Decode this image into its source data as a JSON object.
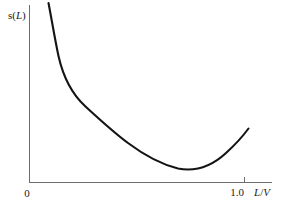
{
  "figure": {
    "background_color": "#ffffff",
    "curve_color": "#141414",
    "axis_color": "#6e6e6e",
    "text_color": "#1a1a1a"
  },
  "labels": {
    "ylabel_prefix": "s(",
    "ylabel_italic": "L",
    "ylabel_suffix": ")",
    "ylabel_full": "s(L)",
    "xlabel_numerator": "L",
    "xlabel_slash": "/",
    "xlabel_denominator": "V",
    "xlabel_full": "L/V",
    "origin_tick": "0",
    "x_tick_one": "1.0"
  },
  "chart_data": {
    "type": "line",
    "title": "",
    "xlabel": "L/V",
    "ylabel": "s(L)",
    "xlim": [
      0,
      1.13
    ],
    "ylim": [
      0,
      1.0
    ],
    "grid": false,
    "legend": null,
    "xticks": [
      0,
      1.0
    ],
    "xticklabels": [
      "0",
      "1.0"
    ],
    "yticks": [],
    "yticklabels": [],
    "series": [
      {
        "name": "s(L)",
        "color": "#141414",
        "x": [
          0.088,
          0.105,
          0.125,
          0.15,
          0.18,
          0.215,
          0.255,
          0.3,
          0.35,
          0.405,
          0.465,
          0.53,
          0.6,
          0.675,
          0.755,
          0.84,
          0.925,
          1.015
        ],
        "y": [
          1.0,
          0.93,
          0.855,
          0.775,
          0.7,
          0.63,
          0.565,
          0.5,
          0.44,
          0.385,
          0.33,
          0.28,
          0.235,
          0.195,
          0.17,
          0.17,
          0.205,
          0.3
        ]
      }
    ],
    "minimum": {
      "x": 0.79,
      "y": 0.165
    }
  },
  "geometry": {
    "y_axis_x": 29,
    "y_axis_top": 5,
    "axis_baseline_y": 182,
    "x_axis_right": 272,
    "tick_one_x": 244,
    "curve_path": "M 48.5 3 C 52.5 24, 55 40, 58.5 56 C 63 76, 72 94, 85 106 C 98 118, 112 131, 128 143 C 144 155, 160 164, 178 168.5 C 196 172, 212 166, 226 153 C 236 144, 243 136, 248.5 128.5"
  }
}
